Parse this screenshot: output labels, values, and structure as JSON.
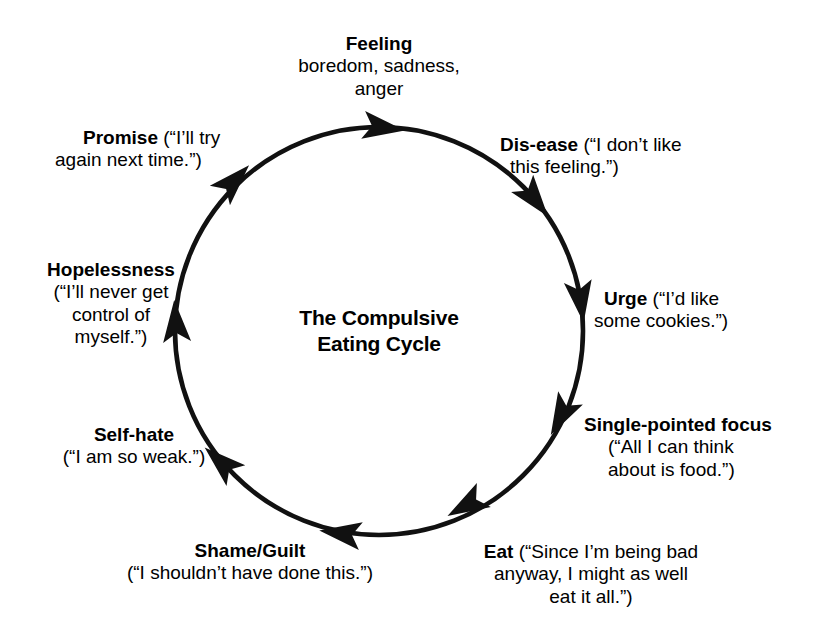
{
  "diagram": {
    "center_title_line1": "The Compulsive",
    "center_title_line2": "Eating Cycle",
    "stroke_color": "#111111",
    "background_color": "#ffffff",
    "direction": "clockwise",
    "stages": [
      {
        "id": "feeling",
        "term": "Feeling",
        "quote_lines": [
          "boredom, sadness,",
          "anger"
        ],
        "position": "top"
      },
      {
        "id": "dis-ease",
        "term": "Dis-ease",
        "quote_lines": [
          "(“I don’t like",
          "this feeling.”)"
        ],
        "position": "top-right"
      },
      {
        "id": "urge",
        "term": "Urge",
        "quote_lines": [
          "(“I’d like",
          "some cookies.”)"
        ],
        "position": "right"
      },
      {
        "id": "single-pointed-focus",
        "term": "Single-pointed focus",
        "quote_lines": [
          "(“All I can think",
          "about is food.”)"
        ],
        "position": "bottom-right"
      },
      {
        "id": "eat",
        "term": "Eat",
        "quote_lines": [
          "(“Since I’m being bad",
          "anyway, I might as well",
          "eat it all.”)"
        ],
        "position": "bottom"
      },
      {
        "id": "shame-guilt",
        "term": "Shame/Guilt",
        "quote_lines": [
          "(“I shouldn’t have done this.”)"
        ],
        "position": "bottom-left"
      },
      {
        "id": "self-hate",
        "term": "Self-hate",
        "quote_lines": [
          "(“I am so weak.”)"
        ],
        "position": "left-lower"
      },
      {
        "id": "hopelessness",
        "term": "Hopelessness",
        "quote_lines": [
          "(“I’ll never get",
          "control of",
          "myself.”)"
        ],
        "position": "left-upper"
      },
      {
        "id": "promise",
        "term": "Promise",
        "quote_lines": [
          "(“I’ll try",
          "again next time.”)"
        ],
        "position": "top-left"
      }
    ]
  },
  "labels": {
    "feeling": {
      "term": "Feeling",
      "l1": "boredom, sadness,",
      "l2": "anger"
    },
    "disease": {
      "term": "Dis-ease",
      "inline": " (“I don’t like",
      "l2": "this feeling.”)"
    },
    "urge": {
      "term": "Urge",
      "inline": " (“I’d like",
      "l2": "some cookies.”)"
    },
    "focus": {
      "term": "Single-pointed focus",
      "l1": "(“All I can think",
      "l2": "about is food.”)"
    },
    "eat": {
      "term": "Eat",
      "inline": " (“Since I’m being bad",
      "l2": "anyway, I might as well",
      "l3": "eat it all.”)"
    },
    "shame": {
      "term": "Shame/Guilt",
      "l1": "(“I shouldn’t have done this.”)"
    },
    "selfhate": {
      "term": "Self-hate",
      "l1": "(“I am so weak.”)"
    },
    "hopelessness": {
      "term": "Hopelessness",
      "l1": "(“I’ll never get",
      "l2": "control of",
      "l3": "myself.”)"
    },
    "promise": {
      "term": "Promise",
      "inline": " (“I’ll try",
      "l2": "again next time.”)"
    }
  }
}
